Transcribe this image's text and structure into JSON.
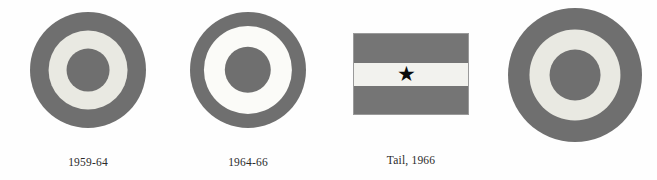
{
  "plate": {
    "background_color": "#fefefe",
    "width": 657,
    "height": 180,
    "description": "Aircraft insignia plate: three roundels and one tail flag, grayscale"
  },
  "palette": {
    "ring_gray": "#6f6f6f",
    "ring_gray_dark": "#636363",
    "cream_white": "#e9e9e2",
    "bright_white": "#fbfbf8",
    "center_gray": "#6f6f6f",
    "flag_gray": "#757575",
    "flag_white": "#f2f2ee",
    "star_black": "#0b0b0b",
    "caption_text": "#2a2a2a",
    "edge_gray": "#9a9a9a"
  },
  "figures": [
    {
      "id": "roundel-1959-64",
      "type": "roundel",
      "name": "roundel-1959-64",
      "caption": "1959-64",
      "geometry": {
        "left": 30,
        "top": 12,
        "size": 116
      },
      "rings": [
        {
          "name": "outer-ring",
          "color": "#6f6f6f",
          "diameter_pct": 100
        },
        {
          "name": "middle-ring",
          "color": "#e9e9e2",
          "diameter_pct": 68
        },
        {
          "name": "center-disc",
          "color": "#6f6f6f",
          "diameter_pct": 37
        }
      ]
    },
    {
      "id": "roundel-1964-66",
      "type": "roundel",
      "name": "roundel-1964-66",
      "caption": "1964-66",
      "geometry": {
        "left": 190,
        "top": 12,
        "size": 116
      },
      "rings": [
        {
          "name": "outer-ring",
          "color": "#6f6f6f",
          "diameter_pct": 100
        },
        {
          "name": "middle-ring",
          "color": "#fbfbf8",
          "diameter_pct": 76
        },
        {
          "name": "center-disc",
          "color": "#6f6f6f",
          "diameter_pct": 40
        }
      ]
    },
    {
      "id": "tail-flag-1966",
      "type": "flag",
      "name": "tail-flag-1966",
      "caption": "Tail, 1966",
      "geometry": {
        "left": 353,
        "top": 33,
        "width": 116,
        "height": 82
      },
      "bands": [
        {
          "name": "top-band",
          "color": "#757575",
          "height_pct": 36
        },
        {
          "name": "middle-band",
          "color": "#f2f2ee",
          "height_pct": 29
        },
        {
          "name": "bottom-band",
          "color": "#757575",
          "height_pct": 35
        }
      ],
      "emblem": {
        "name": "star",
        "glyph": "★",
        "color": "#0b0b0b",
        "size_px": 21,
        "center_x_pct": 46,
        "center_y_pct": 50
      }
    },
    {
      "id": "roundel-unlabeled",
      "type": "roundel",
      "name": "roundel-unlabeled",
      "caption": "",
      "geometry": {
        "left": 508,
        "top": 8,
        "size": 134
      },
      "rings": [
        {
          "name": "outer-ring",
          "color": "#6f6f6f",
          "diameter_pct": 100
        },
        {
          "name": "middle-ring",
          "color": "#e9e9e2",
          "diameter_pct": 68
        },
        {
          "name": "center-disc",
          "color": "#6f6f6f",
          "diameter_pct": 38
        }
      ]
    }
  ],
  "captions": {
    "first": "1959-64",
    "second": "1964-66",
    "third": "Tail, 1966",
    "baseline_y": 156
  }
}
